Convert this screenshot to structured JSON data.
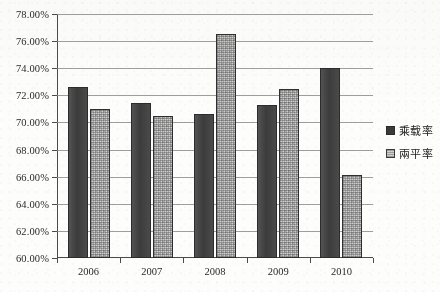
{
  "chart_data": {
    "type": "bar",
    "title": "",
    "subtitle": "",
    "xlabel": "",
    "ylabel": "",
    "categories": [
      "2006",
      "2007",
      "2008",
      "2009",
      "2010"
    ],
    "series": [
      {
        "name": "乘载率",
        "values": [
          72.6,
          71.4,
          70.6,
          71.3,
          74.0
        ],
        "color": "#3f3f3f"
      },
      {
        "name": "兩平率",
        "values": [
          71.0,
          70.5,
          76.5,
          72.5,
          66.1
        ],
        "color": "#cfcfcf"
      }
    ],
    "ylim": [
      60.0,
      78.0
    ],
    "ytick_values": [
      60.0,
      62.0,
      64.0,
      66.0,
      68.0,
      70.0,
      72.0,
      74.0,
      76.0,
      78.0
    ],
    "ytick_labels": [
      "60.00%",
      "62.00%",
      "64.00%",
      "66.00%",
      "68.00%",
      "70.00%",
      "72.00%",
      "74.00%",
      "76.00%",
      "78.00%"
    ],
    "grid": true,
    "legend_position": "right"
  },
  "legend": {
    "items": [
      {
        "label": "乘载率"
      },
      {
        "label": "兩平率"
      }
    ]
  }
}
